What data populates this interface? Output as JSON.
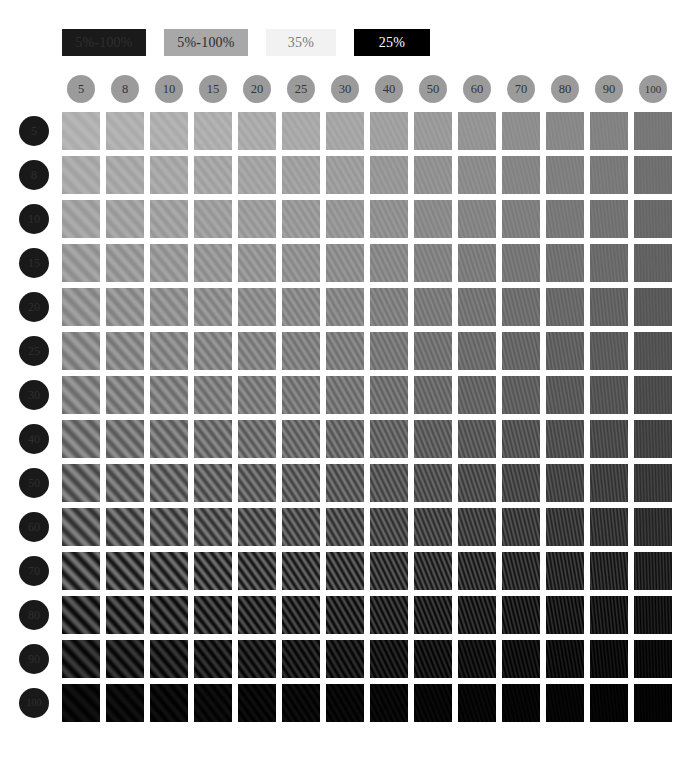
{
  "page": {
    "background_color": "#ffffff"
  },
  "legend": {
    "items": [
      {
        "label": "5%-100%",
        "bg_color": "#1a1a1a",
        "text_color": "#2e2e2e",
        "width_px": 84
      },
      {
        "label": "5%-100%",
        "bg_color": "#a8a8a8",
        "text_color": "#2b2b2b",
        "width_px": 84
      },
      {
        "label": "35%",
        "bg_color": "#f2f2f2",
        "text_color": "#7a7a7a",
        "width_px": 70
      },
      {
        "label": "25%",
        "bg_color": "#000000",
        "text_color": "#ffffff",
        "width_px": 76
      }
    ]
  },
  "columns": {
    "axis_label": "spatial frequency",
    "chip_bg_color": "#9b9b9b",
    "chip_text_color": "#333333",
    "headers": [
      "5",
      "8",
      "10",
      "15",
      "20",
      "25",
      "30",
      "40",
      "50",
      "60",
      "70",
      "80",
      "90",
      "100"
    ]
  },
  "rows": {
    "axis_label": "contrast",
    "chip_bg_color": "#191919",
    "chip_text_color": "#2f2f2f",
    "headers": [
      "5",
      "8",
      "10",
      "15",
      "20",
      "25",
      "30",
      "40",
      "50",
      "60",
      "70",
      "80",
      "90",
      "100"
    ]
  },
  "chart_data": {
    "type": "heatmap",
    "xlabel": "spatial frequency",
    "ylabel": "contrast",
    "grid": false,
    "legend_position": "top-left",
    "categories": [
      "5",
      "8",
      "10",
      "15",
      "20",
      "25",
      "30",
      "40",
      "50",
      "60",
      "70",
      "80",
      "90",
      "100"
    ],
    "row_categories": [
      "5",
      "8",
      "10",
      "15",
      "20",
      "25",
      "30",
      "40",
      "50",
      "60",
      "70",
      "80",
      "90",
      "100"
    ],
    "cell_kind": "diagonal-grating-patch",
    "cell_size_px": 38,
    "cell_gap_px": 6,
    "mean_luminance": [
      [
        178,
        177,
        176,
        175,
        172,
        170,
        167,
        161,
        155,
        149,
        143,
        137,
        131,
        120
      ],
      [
        170,
        169,
        168,
        166,
        164,
        161,
        158,
        152,
        146,
        140,
        134,
        128,
        122,
        112
      ],
      [
        163,
        162,
        161,
        159,
        157,
        154,
        151,
        145,
        139,
        133,
        127,
        121,
        115,
        105
      ],
      [
        155,
        154,
        153,
        151,
        149,
        146,
        143,
        137,
        131,
        125,
        119,
        113,
        107,
        98
      ],
      [
        147,
        146,
        145,
        143,
        141,
        138,
        135,
        129,
        123,
        117,
        111,
        105,
        99,
        90
      ],
      [
        139,
        138,
        137,
        135,
        133,
        130,
        127,
        121,
        115,
        109,
        103,
        97,
        92,
        83
      ],
      [
        131,
        130,
        129,
        127,
        125,
        122,
        119,
        113,
        107,
        101,
        96,
        90,
        85,
        76
      ],
      [
        118,
        117,
        116,
        114,
        112,
        109,
        106,
        101,
        95,
        90,
        85,
        80,
        75,
        67
      ],
      [
        104,
        103,
        102,
        100,
        98,
        96,
        93,
        88,
        83,
        78,
        73,
        69,
        64,
        57
      ],
      [
        90,
        89,
        88,
        86,
        84,
        82,
        79,
        75,
        70,
        66,
        62,
        57,
        53,
        47
      ],
      [
        70,
        69,
        68,
        66,
        64,
        62,
        60,
        56,
        52,
        48,
        45,
        41,
        38,
        33
      ],
      [
        50,
        49,
        48,
        47,
        45,
        43,
        41,
        38,
        35,
        32,
        29,
        26,
        24,
        20
      ],
      [
        32,
        31,
        30,
        29,
        28,
        26,
        25,
        22,
        20,
        18,
        16,
        14,
        12,
        10
      ],
      [
        10,
        10,
        9,
        9,
        8,
        8,
        7,
        7,
        6,
        6,
        5,
        5,
        4,
        4
      ]
    ],
    "modulation_amplitude": [
      [
        6,
        6,
        6,
        6,
        6,
        5,
        5,
        5,
        5,
        4,
        4,
        4,
        4,
        3
      ],
      [
        8,
        8,
        8,
        8,
        7,
        7,
        7,
        6,
        6,
        6,
        5,
        5,
        5,
        4
      ],
      [
        10,
        10,
        10,
        9,
        9,
        9,
        8,
        8,
        7,
        7,
        6,
        6,
        6,
        5
      ],
      [
        13,
        13,
        12,
        12,
        12,
        11,
        11,
        10,
        9,
        9,
        8,
        8,
        7,
        6
      ],
      [
        16,
        16,
        15,
        15,
        14,
        14,
        13,
        12,
        11,
        11,
        10,
        9,
        9,
        7
      ],
      [
        19,
        19,
        18,
        18,
        17,
        16,
        16,
        14,
        13,
        12,
        12,
        11,
        10,
        8
      ],
      [
        22,
        22,
        21,
        20,
        20,
        19,
        18,
        17,
        15,
        14,
        13,
        12,
        11,
        9
      ],
      [
        28,
        27,
        27,
        26,
        25,
        24,
        23,
        21,
        19,
        18,
        17,
        15,
        14,
        11
      ],
      [
        34,
        33,
        33,
        32,
        30,
        29,
        28,
        25,
        23,
        22,
        20,
        18,
        17,
        13
      ],
      [
        40,
        39,
        38,
        37,
        36,
        34,
        33,
        30,
        28,
        26,
        24,
        22,
        20,
        16
      ],
      [
        48,
        47,
        46,
        45,
        43,
        41,
        40,
        36,
        33,
        31,
        28,
        26,
        24,
        19
      ],
      [
        40,
        39,
        38,
        37,
        36,
        34,
        33,
        30,
        28,
        26,
        24,
        22,
        20,
        16
      ],
      [
        26,
        25,
        25,
        24,
        23,
        22,
        21,
        19,
        18,
        16,
        15,
        14,
        12,
        10
      ],
      [
        8,
        8,
        8,
        7,
        7,
        7,
        6,
        6,
        5,
        5,
        4,
        4,
        4,
        3
      ]
    ],
    "stripe_period_px": [
      11.0,
      9.6,
      8.8,
      7.6,
      6.8,
      6.2,
      5.8,
      5.1,
      4.6,
      4.2,
      3.9,
      3.6,
      3.4,
      3.1
    ],
    "stripe_angle_deg": [
      -44,
      -42,
      -40,
      -38,
      -36,
      -33,
      -30,
      -26,
      -22,
      -18,
      -14,
      -10,
      -6,
      -2
    ]
  }
}
